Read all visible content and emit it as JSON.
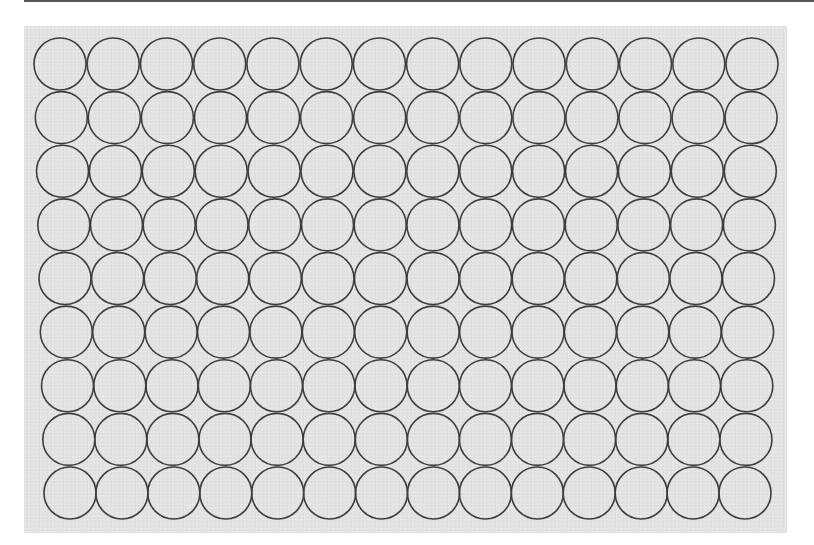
{
  "figure": {
    "type": "circle-packing-grid",
    "rows": 9,
    "columns": 14,
    "circle_radius": 26,
    "row_layout": {
      "first_row": {
        "center_y": 64,
        "first_center_x": 60,
        "last_center_x": 752
      },
      "last_row": {
        "center_y": 493,
        "first_center_x": 70,
        "last_center_x": 745
      }
    },
    "colors": {
      "background": "#ffffff",
      "panel_fill": "#e3e3e3",
      "circle_stroke": "#3d3d3d",
      "top_rule": "#555555"
    },
    "stroke_width": 1.6
  }
}
